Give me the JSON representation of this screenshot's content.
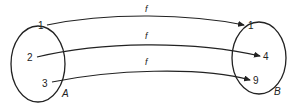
{
  "diagram": {
    "sets": [
      {
        "name": "A",
        "elements": [
          "1",
          "2",
          "3"
        ]
      },
      {
        "name": "B",
        "elements": [
          "1",
          "4",
          "9"
        ]
      }
    ],
    "mappings": [
      {
        "from": "1",
        "to": "1",
        "label": "f"
      },
      {
        "from": "2",
        "to": "4",
        "label": "f"
      },
      {
        "from": "3",
        "to": "9",
        "label": "f"
      }
    ],
    "colors": {
      "stroke": "#222222",
      "background": "#ffffff"
    }
  }
}
